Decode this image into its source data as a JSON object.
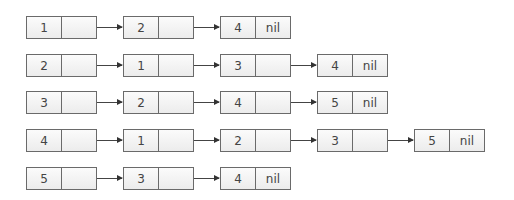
{
  "diagram": {
    "type": "adjacency-list",
    "null_label": "nil",
    "rows": [
      {
        "head": "1",
        "neighbors": [
          "2",
          "4"
        ]
      },
      {
        "head": "2",
        "neighbors": [
          "1",
          "3",
          "4"
        ]
      },
      {
        "head": "3",
        "neighbors": [
          "2",
          "4",
          "5"
        ]
      },
      {
        "head": "4",
        "neighbors": [
          "1",
          "2",
          "3",
          "5"
        ]
      },
      {
        "head": "5",
        "neighbors": [
          "3",
          "4"
        ]
      }
    ]
  }
}
